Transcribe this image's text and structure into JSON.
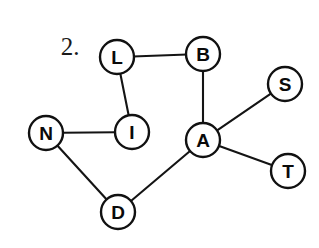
{
  "figure": {
    "problem_number": "2.",
    "problem_number_x": 70,
    "problem_number_y": 46,
    "width": 319,
    "height": 248,
    "background_color": "#ffffff",
    "node_fill_color": "#ffffff",
    "node_stroke_color": "#111111",
    "edge_color": "#141414",
    "label_color": "#0a0a0a",
    "node_radius": 17
  },
  "chart_data": {
    "type": "diagram",
    "diagram_kind": "undirected-graph",
    "title": "2.",
    "nodes": [
      {
        "id": "L",
        "label": "L",
        "x": 117,
        "y": 57
      },
      {
        "id": "B",
        "label": "B",
        "x": 203,
        "y": 54
      },
      {
        "id": "S",
        "label": "S",
        "x": 285,
        "y": 84
      },
      {
        "id": "N",
        "label": "N",
        "x": 46,
        "y": 133
      },
      {
        "id": "I",
        "label": "I",
        "x": 132,
        "y": 132
      },
      {
        "id": "A",
        "label": "A",
        "x": 203,
        "y": 140
      },
      {
        "id": "T",
        "label": "T",
        "x": 288,
        "y": 171
      },
      {
        "id": "D",
        "label": "D",
        "x": 118,
        "y": 212
      }
    ],
    "edges": [
      {
        "id": "L-B",
        "from": "L",
        "to": "B"
      },
      {
        "id": "L-I",
        "from": "L",
        "to": "I"
      },
      {
        "id": "B-A",
        "from": "B",
        "to": "A"
      },
      {
        "id": "N-I",
        "from": "N",
        "to": "I"
      },
      {
        "id": "N-D",
        "from": "N",
        "to": "D"
      },
      {
        "id": "D-A",
        "from": "D",
        "to": "A"
      },
      {
        "id": "A-S",
        "from": "A",
        "to": "S"
      },
      {
        "id": "A-T",
        "from": "A",
        "to": "T"
      }
    ],
    "node_count": 8,
    "edge_count": 8
  }
}
